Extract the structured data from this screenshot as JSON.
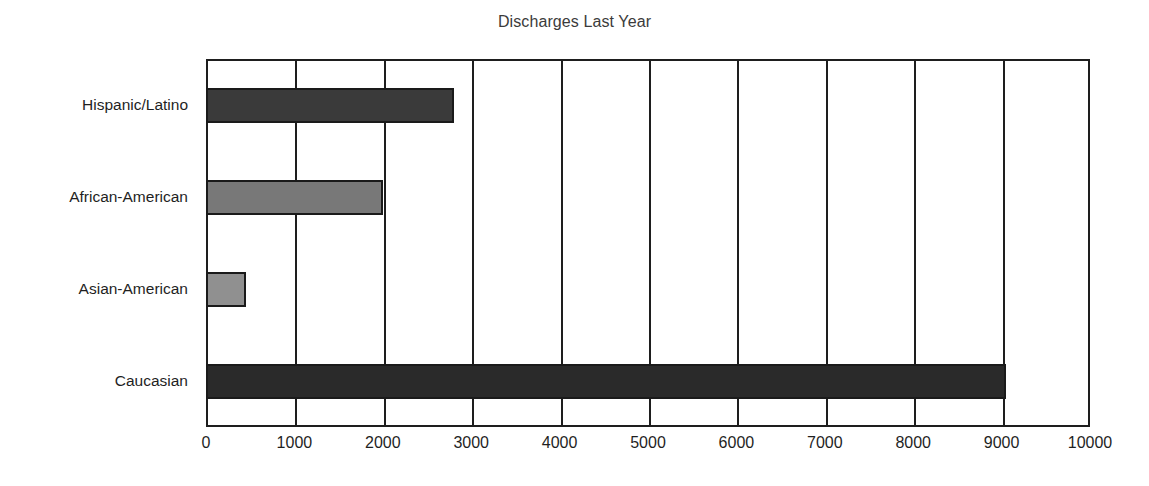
{
  "chart_data": {
    "type": "bar",
    "orientation": "horizontal",
    "title": "Discharges Last Year",
    "xlabel": "",
    "ylabel": "",
    "categories": [
      "Hispanic/Latino",
      "African-American",
      "Asian-American",
      "Caucasian"
    ],
    "values": [
      2800,
      2000,
      450,
      9050
    ],
    "bar_colors": [
      "#3a3a3a",
      "#787878",
      "#909090",
      "#2a2a2a"
    ],
    "xlim": [
      0,
      10000
    ],
    "xticks": [
      0,
      1000,
      2000,
      3000,
      4000,
      5000,
      6000,
      7000,
      8000,
      9000,
      10000
    ],
    "xtick_labels": [
      "0",
      "1000",
      "2000",
      "3000",
      "4000",
      "5000",
      "6000",
      "7000",
      "8000",
      "9000",
      "10000"
    ],
    "grid": "vertical",
    "legend": "none",
    "series": [
      {
        "name": "Discharges Last Year",
        "points": [
          {
            "category": "Hispanic/Latino",
            "value": 2800,
            "color": "#3a3a3a"
          },
          {
            "category": "African-American",
            "value": 2000,
            "color": "#787878"
          },
          {
            "category": "Asian-American",
            "value": 450,
            "color": "#909090"
          },
          {
            "category": "Caucasian",
            "value": 9050,
            "color": "#2a2a2a"
          }
        ]
      }
    ]
  },
  "axis": {
    "frame_color": "#1e1e1e",
    "bar_edge_color": "#1a1a1a",
    "background": "#ffffff"
  }
}
